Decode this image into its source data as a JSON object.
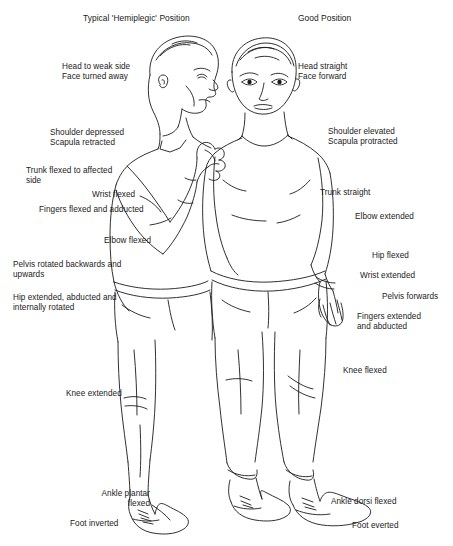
{
  "figure": {
    "headings": [
      {
        "id": "heading-left",
        "text": "Typical 'Hemiplegic' Position",
        "x": 83,
        "y": 13
      },
      {
        "id": "heading-right",
        "text": "Good Position",
        "x": 298,
        "y": 13
      }
    ],
    "left_labels": [
      {
        "id": "head-to-weak-side",
        "text": "Head to weak side\nFace turned away",
        "x": 62,
        "y": 62,
        "align": "left"
      },
      {
        "id": "shoulder-depressed",
        "text": "Shoulder depressed\nScapula retracted",
        "x": 50,
        "y": 128,
        "align": "left"
      },
      {
        "id": "trunk-flexed",
        "text": "Trunk flexed to affected\n side",
        "x": 26,
        "y": 166,
        "align": "left"
      },
      {
        "id": "wrist-flexed",
        "text": "Wrist flexed",
        "x": 92,
        "y": 190,
        "align": "left"
      },
      {
        "id": "fingers-flexed-adducted",
        "text": "Fingers flexed and adducted",
        "x": 39,
        "y": 205,
        "align": "left"
      },
      {
        "id": "elbow-flexed",
        "text": "Elbow flexed",
        "x": 104,
        "y": 236,
        "align": "left"
      },
      {
        "id": "pelvis-rotated",
        "text": "Pelvis rotated backwards and\nupwards",
        "x": 13,
        "y": 260,
        "align": "left"
      },
      {
        "id": "hip-extended",
        "text": "Hip extended, abducted and\ninternally rotated",
        "x": 13,
        "y": 293,
        "align": "left"
      },
      {
        "id": "knee-extended",
        "text": "Knee extended",
        "x": 66,
        "y": 389,
        "align": "left"
      },
      {
        "id": "ankle-plantar-flexed",
        "text": "Ankle plantar\nflexed",
        "x": 60,
        "y": 489,
        "align": "right",
        "width": 90
      },
      {
        "id": "foot-inverted",
        "text": "Foot inverted",
        "x": 70,
        "y": 519,
        "align": "left"
      }
    ],
    "right_labels": [
      {
        "id": "head-straight",
        "text": "Head straight\nFace forward",
        "x": 298,
        "y": 62,
        "align": "left"
      },
      {
        "id": "shoulder-elevated",
        "text": "Shoulder elevated",
        "x": 328,
        "y": 127,
        "align": "left"
      },
      {
        "id": "scapula-protracted",
        "text": "Scapula protracted",
        "x": 328,
        "y": 137,
        "align": "left"
      },
      {
        "id": "trunk-straight",
        "text": "Trunk straight",
        "x": 320,
        "y": 188,
        "align": "left"
      },
      {
        "id": "elbow-extended",
        "text": "Elbow extended",
        "x": 355,
        "y": 212,
        "align": "left"
      },
      {
        "id": "hip-flexed",
        "text": "Hip flexed",
        "x": 372,
        "y": 251,
        "align": "left"
      },
      {
        "id": "wrist-extended",
        "text": "Wrist extended",
        "x": 360,
        "y": 271,
        "align": "left"
      },
      {
        "id": "pelvis-forwards",
        "text": "Pelvis forwards",
        "x": 382,
        "y": 292,
        "align": "left"
      },
      {
        "id": "fingers-extended-abducted",
        "text": "Fingers extended\nand abducted",
        "x": 357,
        "y": 312,
        "align": "left"
      },
      {
        "id": "knee-flexed",
        "text": "Knee flexed",
        "x": 343,
        "y": 366,
        "align": "left"
      },
      {
        "id": "ankle-dorsi-flexed",
        "text": "Ankle dorsi flexed",
        "x": 331,
        "y": 497,
        "align": "left"
      },
      {
        "id": "foot-everted",
        "text": "Foot everted",
        "x": 352,
        "y": 521,
        "align": "left"
      }
    ],
    "illustration": {
      "name": "two-standing-figures-line-drawing",
      "description": "Line drawing of two standing male figures seen from the front; left figure shows a typical hemiplegic posture with head turned away and flexed arm, right figure shows good upright posture",
      "stroke_color": "#1a1a1a",
      "background_color": "#ffffff"
    },
    "footer_partial": "a line of text partially cropped at the bottom edge"
  }
}
